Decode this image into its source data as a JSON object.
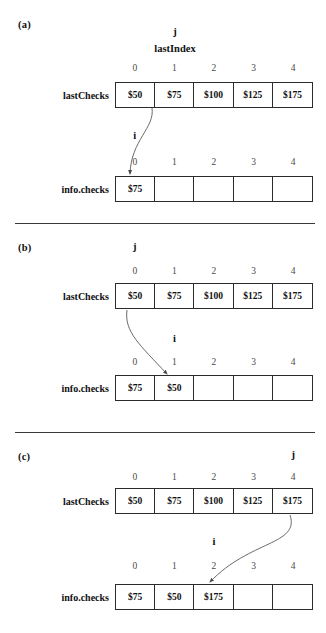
{
  "figure": {
    "array_labels": {
      "source": "lastChecks",
      "dest": "info.checks"
    },
    "index_labels": [
      "0",
      "1",
      "2",
      "3",
      "4"
    ],
    "pointer_names": {
      "j": "j",
      "i": "i",
      "lastIndex": "lastIndex"
    }
  },
  "panels": [
    {
      "id": "a",
      "label": "(a)",
      "source_row": {
        "name": "lastChecks",
        "indices": [
          "0",
          "1",
          "2",
          "3",
          "4"
        ],
        "values": [
          "$50",
          "$75",
          "$100",
          "$125",
          "$175"
        ]
      },
      "dest_row": {
        "name": "info.checks",
        "indices": [
          "0",
          "1",
          "2",
          "3",
          "4"
        ],
        "values": [
          "$75",
          "",
          "",
          "",
          ""
        ]
      },
      "pointers": {
        "j_label": "j",
        "j_index": 1,
        "extra_label": "lastIndex",
        "i_label": "i",
        "i_index": 0
      },
      "arrow": {
        "from_index": 1,
        "to_index": 0
      }
    },
    {
      "id": "b",
      "label": "(b)",
      "source_row": {
        "name": "lastChecks",
        "indices": [
          "0",
          "1",
          "2",
          "3",
          "4"
        ],
        "values": [
          "$50",
          "$75",
          "$100",
          "$125",
          "$175"
        ]
      },
      "dest_row": {
        "name": "info.checks",
        "indices": [
          "0",
          "1",
          "2",
          "3",
          "4"
        ],
        "values": [
          "$75",
          "$50",
          "",
          "",
          ""
        ]
      },
      "pointers": {
        "j_label": "j",
        "j_index": 0,
        "extra_label": "",
        "i_label": "i",
        "i_index": 1
      },
      "arrow": {
        "from_index": 0,
        "to_index": 1
      }
    },
    {
      "id": "c",
      "label": "(c)",
      "source_row": {
        "name": "lastChecks",
        "indices": [
          "0",
          "1",
          "2",
          "3",
          "4"
        ],
        "values": [
          "$50",
          "$75",
          "$100",
          "$125",
          "$175"
        ]
      },
      "dest_row": {
        "name": "info.checks",
        "indices": [
          "0",
          "1",
          "2",
          "3",
          "4"
        ],
        "values": [
          "$75",
          "$50",
          "$175",
          "",
          ""
        ]
      },
      "pointers": {
        "j_label": "j",
        "j_index": 4,
        "extra_label": "",
        "i_label": "i",
        "i_index": 2
      },
      "arrow": {
        "from_index": 4,
        "to_index": 2
      }
    }
  ],
  "colors": {
    "ink": "#2b2b2b",
    "background": "#ffffff",
    "arrow": "#555555"
  }
}
